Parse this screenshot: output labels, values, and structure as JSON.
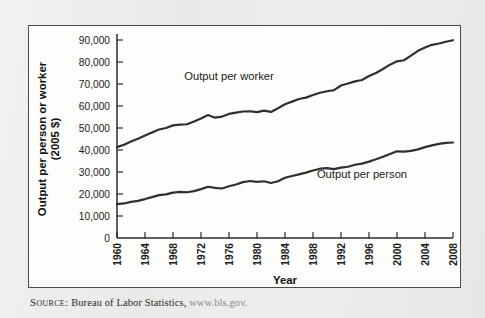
{
  "figure": {
    "source_label": "Source:",
    "source_text": "Bureau of Labor Statistics,",
    "source_url": "www.bls.gov."
  },
  "chart_data": {
    "type": "line",
    "title": "",
    "xlabel": "Year",
    "ylabel": "Output per person or worker (2005 $)",
    "ylabel_line1": "Output per person or worker",
    "ylabel_line2": "(2005 $)",
    "xlim": [
      1960,
      2008
    ],
    "ylim": [
      0,
      90000
    ],
    "grid": false,
    "legend_position": "inline-annotations",
    "y_ticks": [
      0,
      10000,
      20000,
      30000,
      40000,
      50000,
      60000,
      70000,
      80000,
      90000
    ],
    "y_tick_labels": [
      "0",
      "10,000",
      "20,000",
      "30,000",
      "40,000",
      "50,000",
      "60,000",
      "70,000",
      "80,000",
      "90,000"
    ],
    "x_ticks": [
      1960,
      1964,
      1968,
      1972,
      1976,
      1980,
      1984,
      1988,
      1992,
      1996,
      2000,
      2004,
      2008
    ],
    "x_tick_labels": [
      "1960",
      "1964",
      "1968",
      "1972",
      "1976",
      "1980",
      "1984",
      "1988",
      "1992",
      "1996",
      "2000",
      "2004",
      "2008"
    ],
    "x": [
      1960,
      1961,
      1962,
      1963,
      1964,
      1965,
      1966,
      1967,
      1968,
      1969,
      1970,
      1971,
      1972,
      1973,
      1974,
      1975,
      1976,
      1977,
      1978,
      1979,
      1980,
      1981,
      1982,
      1983,
      1984,
      1985,
      1986,
      1987,
      1988,
      1989,
      1990,
      1991,
      1992,
      1993,
      1994,
      1995,
      1996,
      1997,
      1998,
      1999,
      2000,
      2001,
      2002,
      2003,
      2004,
      2005,
      2006,
      2007,
      2008
    ],
    "series": [
      {
        "name": "Output per worker",
        "label": "Output per worker",
        "color": "#2f2f2f",
        "label_x": 1976,
        "label_y": 72000,
        "values": [
          41300,
          42400,
          43900,
          45100,
          46600,
          48000,
          49300,
          50000,
          51200,
          51500,
          51700,
          53000,
          54300,
          55900,
          54700,
          55200,
          56400,
          57000,
          57500,
          57600,
          57200,
          57900,
          57300,
          59000,
          60800,
          62000,
          63200,
          63800,
          65000,
          66000,
          66700,
          67200,
          69300,
          70200,
          71200,
          71800,
          73600,
          75000,
          76800,
          78800,
          80300,
          80800,
          82900,
          85100,
          86600,
          87800,
          88400,
          89200,
          89900
        ]
      },
      {
        "name": "Output per person",
        "label": "Output per person",
        "color": "#2f2f2f",
        "label_x": 1995,
        "label_y": 27500,
        "values": [
          15400,
          15700,
          16400,
          16900,
          17700,
          18600,
          19500,
          19800,
          20600,
          21000,
          20800,
          21300,
          22200,
          23300,
          22800,
          22500,
          23500,
          24300,
          25400,
          25900,
          25500,
          25800,
          25000,
          25800,
          27400,
          28200,
          28900,
          29700,
          30700,
          31500,
          31800,
          31300,
          32000,
          32400,
          33300,
          33800,
          34700,
          35800,
          36900,
          38200,
          39400,
          39300,
          39600,
          40300,
          41300,
          42100,
          42800,
          43200,
          43400
        ]
      }
    ]
  }
}
